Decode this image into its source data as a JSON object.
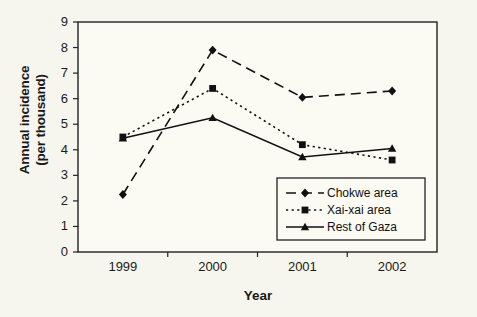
{
  "chart_data": {
    "type": "line",
    "title": "",
    "xlabel": "Year",
    "ylabel": "Annual incidence (per thousand)",
    "ylabel_line1": "Annual incidence",
    "ylabel_line2": "(per thousand)",
    "categories": [
      "1999",
      "2000",
      "2001",
      "2002"
    ],
    "x": [
      1999,
      2000,
      2001,
      2002
    ],
    "ylim": [
      0,
      9
    ],
    "yticks": [
      "0",
      "1",
      "2",
      "3",
      "4",
      "5",
      "6",
      "7",
      "8",
      "9"
    ],
    "ytick_values": [
      0,
      1,
      2,
      3,
      4,
      5,
      6,
      7,
      8,
      9
    ],
    "grid": false,
    "legend_position": "lower-right",
    "series": [
      {
        "name": "Chokwe area",
        "values": [
          2.25,
          7.9,
          6.05,
          6.3
        ],
        "marker": "diamond",
        "line_style": "dashed",
        "color": "#111111"
      },
      {
        "name": "Xai-xai area",
        "values": [
          4.5,
          6.4,
          4.2,
          3.6
        ],
        "marker": "square",
        "line_style": "dotted",
        "color": "#111111"
      },
      {
        "name": "Rest of Gaza",
        "values": [
          4.45,
          5.25,
          3.72,
          4.05
        ],
        "marker": "triangle",
        "line_style": "solid",
        "color": "#111111"
      }
    ]
  },
  "colors": {
    "background": "#f7f6ee",
    "plot_background": "#fbfaf3",
    "axis": "#222222",
    "series": "#111111"
  }
}
